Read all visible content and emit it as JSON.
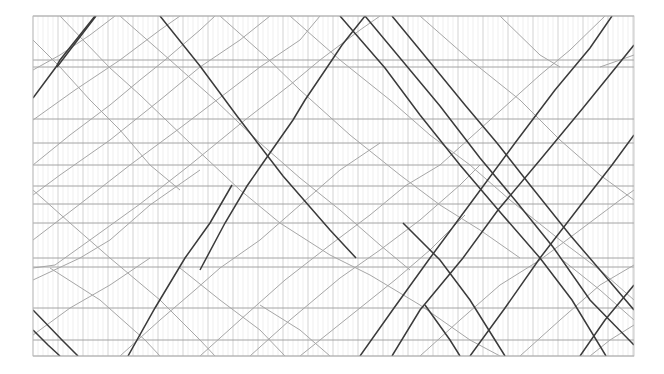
{
  "diagram": {
    "type": "train-timetable-graph",
    "plot_area": {
      "x0": 33,
      "y0": 16,
      "x1": 634,
      "y1": 356
    },
    "colors": {
      "background": "#ffffff",
      "minor_grid": "#e4e4e4",
      "major_grid": "#c8c8c8",
      "station_line": "#9a9a9a",
      "train_light": "#a6a6a6",
      "train_dark": "#3a3a3a"
    },
    "grid": {
      "minor_step": 5,
      "major_step": 25
    },
    "stations_y": [
      16,
      60,
      67,
      119,
      143,
      165,
      186,
      204,
      223,
      258,
      267,
      308,
      340,
      356
    ],
    "trains_dark": [
      [
        [
          33,
          98
        ],
        [
          56,
          67
        ],
        [
          60,
          60
        ],
        [
          95,
          16
        ]
      ],
      [
        [
          57,
          67
        ],
        [
          73,
          46
        ],
        [
          96,
          16
        ]
      ],
      [
        [
          160,
          16
        ],
        [
          200,
          66
        ],
        [
          237,
          116
        ],
        [
          283,
          176
        ],
        [
          330,
          230
        ],
        [
          356,
          258
        ]
      ],
      [
        [
          200,
          270
        ],
        [
          225,
          223
        ],
        [
          247,
          186
        ],
        [
          265,
          160
        ],
        [
          293,
          120
        ],
        [
          305,
          100
        ],
        [
          332,
          60
        ],
        [
          342,
          45
        ],
        [
          365,
          16
        ]
      ],
      [
        [
          128,
          356
        ],
        [
          155,
          308
        ],
        [
          185,
          258
        ],
        [
          210,
          223
        ],
        [
          232,
          185
        ]
      ],
      [
        [
          340,
          16
        ],
        [
          385,
          68
        ],
        [
          420,
          115
        ],
        [
          460,
          165
        ],
        [
          500,
          212
        ],
        [
          540,
          258
        ],
        [
          572,
          300
        ],
        [
          606,
          356
        ]
      ],
      [
        [
          365,
          16
        ],
        [
          400,
          58
        ],
        [
          440,
          106
        ],
        [
          480,
          158
        ],
        [
          515,
          200
        ],
        [
          553,
          247
        ],
        [
          590,
          300
        ],
        [
          634,
          345
        ]
      ],
      [
        [
          392,
          16
        ],
        [
          420,
          50
        ],
        [
          465,
          105
        ],
        [
          497,
          143
        ],
        [
          530,
          185
        ],
        [
          570,
          235
        ],
        [
          600,
          270
        ],
        [
          634,
          310
        ]
      ],
      [
        [
          360,
          356
        ],
        [
          394,
          308
        ],
        [
          430,
          258
        ],
        [
          470,
          204
        ],
        [
          515,
          143
        ],
        [
          555,
          90
        ],
        [
          590,
          48
        ],
        [
          612,
          16
        ]
      ],
      [
        [
          392,
          356
        ],
        [
          420,
          310
        ],
        [
          463,
          258
        ],
        [
          498,
          210
        ],
        [
          540,
          160
        ],
        [
          583,
          108
        ],
        [
          634,
          45
        ]
      ],
      [
        [
          470,
          356
        ],
        [
          505,
          308
        ],
        [
          540,
          258
        ],
        [
          580,
          206
        ],
        [
          612,
          165
        ],
        [
          634,
          135
        ]
      ],
      [
        [
          580,
          356
        ],
        [
          605,
          320
        ],
        [
          634,
          285
        ]
      ],
      [
        [
          33,
          310
        ],
        [
          62,
          340
        ],
        [
          78,
          356
        ]
      ],
      [
        [
          33,
          330
        ],
        [
          48,
          345
        ],
        [
          60,
          356
        ]
      ],
      [
        [
          403,
          223
        ],
        [
          440,
          260
        ],
        [
          470,
          300
        ],
        [
          495,
          340
        ],
        [
          505,
          356
        ]
      ],
      [
        [
          425,
          305
        ],
        [
          450,
          340
        ],
        [
          460,
          356
        ]
      ]
    ],
    "trains_light": [
      [
        [
          33,
          70
        ],
        [
          60,
          55
        ],
        [
          90,
          35
        ],
        [
          115,
          16
        ]
      ],
      [
        [
          60,
          16
        ],
        [
          110,
          68
        ],
        [
          140,
          95
        ],
        [
          190,
          143
        ],
        [
          240,
          190
        ],
        [
          280,
          223
        ],
        [
          330,
          255
        ],
        [
          370,
          275
        ],
        [
          420,
          305
        ],
        [
          470,
          340
        ],
        [
          500,
          356
        ]
      ],
      [
        [
          33,
          120
        ],
        [
          75,
          90
        ],
        [
          120,
          60
        ],
        [
          160,
          30
        ],
        [
          180,
          16
        ]
      ],
      [
        [
          33,
          165
        ],
        [
          70,
          135
        ],
        [
          110,
          105
        ],
        [
          140,
          80
        ],
        [
          165,
          60
        ],
        [
          200,
          30
        ],
        [
          215,
          16
        ]
      ],
      [
        [
          33,
          195
        ],
        [
          60,
          175
        ],
        [
          110,
          140
        ],
        [
          160,
          100
        ],
        [
          200,
          67
        ],
        [
          240,
          40
        ],
        [
          270,
          16
        ]
      ],
      [
        [
          33,
          240
        ],
        [
          80,
          204
        ],
        [
          130,
          165
        ],
        [
          180,
          128
        ],
        [
          230,
          90
        ],
        [
          260,
          67
        ],
        [
          300,
          40
        ],
        [
          320,
          16
        ]
      ],
      [
        [
          33,
          268
        ],
        [
          55,
          265
        ],
        [
          90,
          240
        ],
        [
          140,
          204
        ],
        [
          190,
          165
        ],
        [
          245,
          120
        ],
        [
          290,
          85
        ],
        [
          320,
          60
        ],
        [
          360,
          30
        ],
        [
          380,
          16
        ]
      ],
      [
        [
          33,
          280
        ],
        [
          80,
          258
        ],
        [
          110,
          240
        ],
        [
          150,
          205
        ],
        [
          200,
          170
        ]
      ],
      [
        [
          33,
          190
        ],
        [
          70,
          223
        ],
        [
          110,
          258
        ],
        [
          160,
          300
        ],
        [
          200,
          340
        ],
        [
          215,
          356
        ]
      ],
      [
        [
          50,
          268
        ],
        [
          100,
          300
        ],
        [
          145,
          340
        ],
        [
          160,
          356
        ]
      ],
      [
        [
          120,
          16
        ],
        [
          170,
          60
        ],
        [
          215,
          100
        ],
        [
          260,
          143
        ],
        [
          300,
          178
        ],
        [
          340,
          210
        ],
        [
          380,
          245
        ],
        [
          410,
          270
        ]
      ],
      [
        [
          220,
          16
        ],
        [
          265,
          56
        ],
        [
          300,
          90
        ],
        [
          350,
          135
        ],
        [
          400,
          175
        ],
        [
          440,
          205
        ],
        [
          480,
          230
        ],
        [
          520,
          258
        ]
      ],
      [
        [
          290,
          16
        ],
        [
          340,
          60
        ],
        [
          390,
          100
        ],
        [
          430,
          135
        ],
        [
          470,
          165
        ],
        [
          510,
          200
        ],
        [
          560,
          240
        ],
        [
          600,
          270
        ],
        [
          634,
          300
        ]
      ],
      [
        [
          420,
          16
        ],
        [
          470,
          60
        ],
        [
          520,
          100
        ],
        [
          560,
          140
        ],
        [
          600,
          175
        ],
        [
          634,
          200
        ]
      ],
      [
        [
          200,
          356
        ],
        [
          240,
          320
        ],
        [
          285,
          280
        ],
        [
          330,
          245
        ],
        [
          370,
          215
        ],
        [
          405,
          186
        ],
        [
          440,
          165
        ],
        [
          490,
          120
        ],
        [
          540,
          75
        ],
        [
          570,
          50
        ],
        [
          605,
          16
        ]
      ],
      [
        [
          250,
          356
        ],
        [
          290,
          320
        ],
        [
          340,
          278
        ],
        [
          380,
          250
        ],
        [
          420,
          220
        ],
        [
          460,
          185
        ],
        [
          480,
          165
        ]
      ],
      [
        [
          300,
          356
        ],
        [
          345,
          320
        ],
        [
          395,
          280
        ],
        [
          430,
          250
        ],
        [
          465,
          215
        ]
      ],
      [
        [
          420,
          356
        ],
        [
          460,
          320
        ],
        [
          500,
          285
        ],
        [
          540,
          260
        ],
        [
          580,
          230
        ],
        [
          620,
          200
        ],
        [
          634,
          190
        ]
      ],
      [
        [
          520,
          356
        ],
        [
          560,
          320
        ],
        [
          600,
          285
        ],
        [
          634,
          265
        ]
      ],
      [
        [
          590,
          356
        ],
        [
          610,
          340
        ],
        [
          634,
          325
        ]
      ],
      [
        [
          120,
          356
        ],
        [
          160,
          320
        ],
        [
          195,
          290
        ],
        [
          220,
          268
        ],
        [
          260,
          240
        ],
        [
          300,
          205
        ],
        [
          340,
          170
        ],
        [
          380,
          143
        ]
      ],
      [
        [
          33,
          335
        ],
        [
          70,
          308
        ],
        [
          110,
          285
        ],
        [
          150,
          258
        ]
      ],
      [
        [
          260,
          305
        ],
        [
          300,
          330
        ],
        [
          330,
          356
        ]
      ],
      [
        [
          180,
          268
        ],
        [
          220,
          300
        ],
        [
          260,
          330
        ],
        [
          285,
          356
        ]
      ],
      [
        [
          500,
          16
        ],
        [
          540,
          55
        ],
        [
          560,
          67
        ]
      ],
      [
        [
          560,
          258
        ],
        [
          600,
          290
        ],
        [
          634,
          320
        ]
      ],
      [
        [
          600,
          67
        ],
        [
          620,
          60
        ],
        [
          634,
          55
        ]
      ],
      [
        [
          33,
          40
        ],
        [
          60,
          67
        ],
        [
          90,
          100
        ],
        [
          120,
          130
        ],
        [
          150,
          165
        ],
        [
          180,
          190
        ]
      ]
    ]
  }
}
